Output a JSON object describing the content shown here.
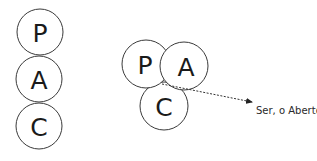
{
  "diagram": {
    "stack": {
      "circles": [
        {
          "label": "P",
          "cx": 40,
          "cy": 32,
          "r": 23
        },
        {
          "label": "A",
          "cx": 39,
          "cy": 80,
          "r": 23
        },
        {
          "label": "C",
          "cx": 39,
          "cy": 126,
          "r": 23
        }
      ]
    },
    "cluster": {
      "circles": [
        {
          "label": "P",
          "cx": 146,
          "cy": 64,
          "r": 24
        },
        {
          "label": "A",
          "cx": 184,
          "cy": 66,
          "r": 24
        },
        {
          "label": "C",
          "cx": 164,
          "cy": 106,
          "r": 24
        }
      ],
      "arrow": {
        "x1": 162,
        "y1": 83,
        "x2": 252,
        "y2": 102
      },
      "annotation": "Ser, o Aberto"
    },
    "colors": {
      "stroke": "#3a3a3a",
      "text": "#1a1a1a",
      "background": "#ffffff"
    }
  }
}
